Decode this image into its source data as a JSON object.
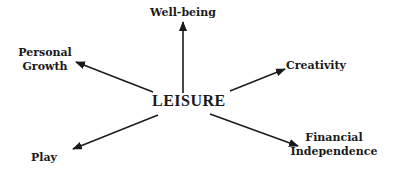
{
  "diagram": {
    "center": {
      "label": "LEISURE"
    },
    "nodes": [
      {
        "id": "well-being",
        "label": "Well-being"
      },
      {
        "id": "personal-growth",
        "line1": "Personal",
        "line2": "Growth"
      },
      {
        "id": "creativity",
        "label": "Creativity"
      },
      {
        "id": "play",
        "label": "Play"
      },
      {
        "id": "financial-independence",
        "line1": "Financial",
        "line2": "Independence"
      }
    ],
    "colors": {
      "ink": "#1a1a1a",
      "background": "#ffffff"
    }
  }
}
